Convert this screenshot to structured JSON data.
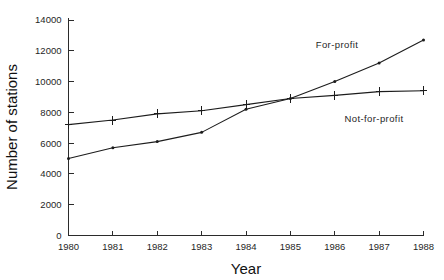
{
  "chart_data": {
    "type": "line",
    "title": "",
    "xlabel": "Year",
    "ylabel": "Number of stations",
    "x": [
      1980,
      1981,
      1982,
      1983,
      1984,
      1985,
      1986,
      1987,
      1988
    ],
    "xtick_labels": [
      "1980",
      "1981",
      "1982",
      "1983",
      "1984",
      "1985",
      "1986",
      "1987",
      "1988"
    ],
    "ytick_labels": [
      "0",
      "2000",
      "4000",
      "6000",
      "8000",
      "10000",
      "12000",
      "14000"
    ],
    "yticks": [
      0,
      2000,
      4000,
      6000,
      8000,
      10000,
      12000,
      14000
    ],
    "xlim": [
      1980,
      1988
    ],
    "ylim": [
      0,
      14000
    ],
    "grid": false,
    "legend": "inline-annotations",
    "series": [
      {
        "name": "For-profit",
        "marker": "dot",
        "values": [
          5000,
          5700,
          6100,
          6700,
          8200,
          8900,
          10000,
          11200,
          12700
        ]
      },
      {
        "name": "Not-for-profit",
        "marker": "plus",
        "values": [
          7200,
          7500,
          7900,
          8100,
          8500,
          8900,
          9100,
          9350,
          9400
        ]
      }
    ],
    "annotations": [
      {
        "text": "For-profit",
        "x_px": 337,
        "y_px": 48
      },
      {
        "text": "Not-for-profit",
        "x_px": 374,
        "y_px": 122
      }
    ],
    "colors": {
      "line": "#1c1c1c",
      "axis": "#2b2b2b",
      "background": "#ffffff",
      "text": "#1f1f1f"
    }
  }
}
